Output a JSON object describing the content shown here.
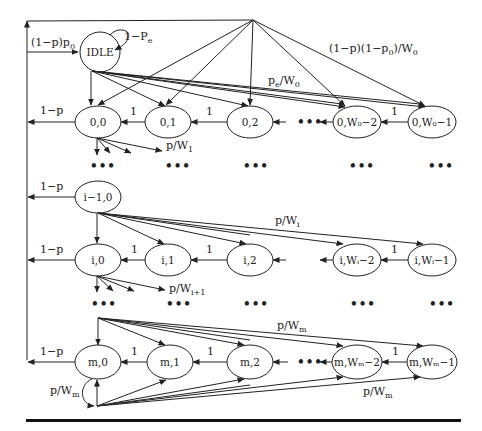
{
  "diagram": {
    "type": "markov-chain",
    "idle": {
      "label": "IDLE",
      "self_loop": "1−P",
      "self_loop_sub": "e",
      "entry": "(1−p)p",
      "entry_sub": "0"
    },
    "top_edge_label": {
      "main": "(1−p)(1−p",
      "sub": "0",
      "tail": ")/W",
      "sub2": "0"
    },
    "pe_label": {
      "main": "p",
      "sub": "e",
      "tail": "/W",
      "sub2": "0"
    },
    "back_label": "1−p",
    "one": "1",
    "ellipsis": "•••",
    "row0": {
      "nodes": [
        "0,0",
        "0,1",
        "0,2",
        "0,W₀−2",
        "0,W₀−1"
      ],
      "fanout": {
        "main": "p/W",
        "sub": "1"
      }
    },
    "row_prev": {
      "node": "i−1,0",
      "fanout": {
        "main": "p/W",
        "sub": "i"
      }
    },
    "row_i": {
      "nodes": [
        "i,0",
        "i,1",
        "i,2",
        "i,Wᵢ−2",
        "i,Wᵢ−1"
      ],
      "fanout": {
        "main": "p/W",
        "sub": "i+1"
      }
    },
    "row_m": {
      "nodes": [
        "m,0",
        "m,1",
        "m,2",
        "m,Wₘ−2",
        "m,Wₘ−1"
      ],
      "top_label": {
        "main": "p/W",
        "sub": "m"
      },
      "bottom_label": {
        "main": "p/W",
        "sub": "m"
      },
      "self_label": {
        "main": "p/W",
        "sub": "m"
      }
    }
  }
}
